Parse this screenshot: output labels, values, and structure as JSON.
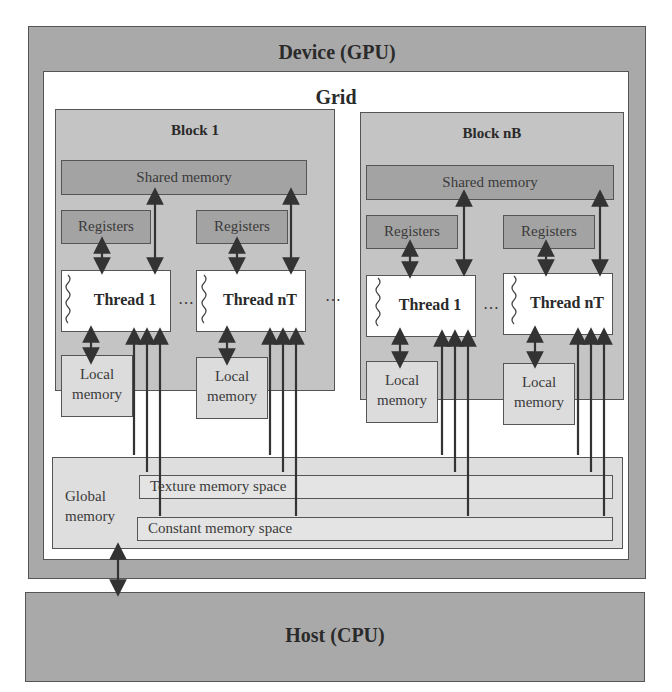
{
  "device": {
    "title": "Device (GPU)"
  },
  "grid": {
    "title": "Grid",
    "ellipsis": "…",
    "blocks": [
      {
        "title": "Block 1",
        "shared_memory": "Shared memory",
        "threads": [
          {
            "registers": "Registers",
            "label": "Thread 1",
            "local_memory_line1": "Local",
            "local_memory_line2": "memory"
          },
          {
            "registers": "Registers",
            "label": "Thread nT",
            "local_memory_line1": "Local",
            "local_memory_line2": "memory"
          }
        ],
        "thread_ellipsis": "…"
      },
      {
        "title": "Block nB",
        "shared_memory": "Shared memory",
        "threads": [
          {
            "registers": "Registers",
            "label": "Thread 1",
            "local_memory_line1": "Local",
            "local_memory_line2": "memory"
          },
          {
            "registers": "Registers",
            "label": "Thread nT",
            "local_memory_line1": "Local",
            "local_memory_line2": "memory"
          }
        ],
        "thread_ellipsis": "…"
      }
    ],
    "global_memory": {
      "label_line1": "Global",
      "label_line2": "memory",
      "texture_space": "Texture memory space",
      "constant_space": "Constant memory space"
    }
  },
  "host": {
    "title": "Host (CPU)"
  },
  "colors": {
    "device_bg": "#a9a9a9",
    "block_bg": "#c4c4c4",
    "memory_dark": "#a3a3a3",
    "global_bg": "#dedede",
    "line": "#333333"
  }
}
